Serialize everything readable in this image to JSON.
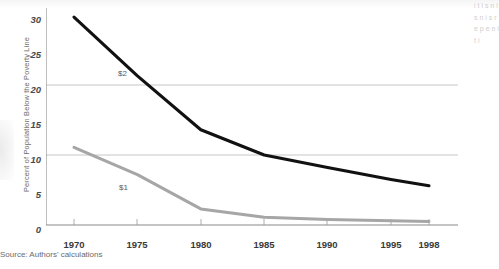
{
  "chart_data": {
    "type": "line",
    "title": "",
    "xlabel": "",
    "ylabel": "Percent of Population Below the Poverty Line",
    "xlim": [
      1968,
      2000
    ],
    "ylim": [
      0,
      30
    ],
    "yticks": [
      0,
      5,
      10,
      15,
      20,
      25,
      30
    ],
    "ytick_labels": [
      "0",
      "5",
      "10",
      "15",
      "20",
      "25",
      "30"
    ],
    "xticks": [
      1970,
      1975,
      1980,
      1985,
      1990,
      1995,
      1998
    ],
    "xtick_labels": [
      "1970",
      "1975",
      "1980",
      "1985",
      "1990",
      "1995",
      "1998"
    ],
    "gridlines": {
      "y": [
        10,
        20
      ],
      "x": [],
      "visible": true
    },
    "legend_position": "inline-annotations",
    "x": [
      1970,
      1975,
      1980,
      1985,
      1990,
      1995,
      1998
    ],
    "series": [
      {
        "name": "$2",
        "label": "$2",
        "color": "#111111",
        "values": [
          29.7,
          21.3,
          13.6,
          10.0,
          8.2,
          6.5,
          5.6
        ],
        "annotation": {
          "text": "$2",
          "x": 1974.2,
          "y": 22.2
        }
      },
      {
        "name": "$1",
        "label": "$1",
        "color": "#a6a6a6",
        "values": [
          11.1,
          7.2,
          2.3,
          1.1,
          0.8,
          0.6,
          0.5
        ],
        "annotation": {
          "text": "$1",
          "x": 1974.3,
          "y": 5.9
        }
      }
    ]
  },
  "source_note": "Source: Authors' calculations",
  "side_column_text": "i t l s n i s n i s r e p e n i t i"
}
